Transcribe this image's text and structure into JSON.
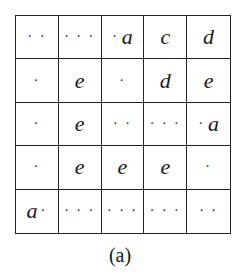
{
  "figure": {
    "caption": "(a)",
    "rows": [
      [
        {
          "dots_before": "· ·",
          "letter": "",
          "dots_after": ""
        },
        {
          "dots_before": "· · ·",
          "letter": "",
          "dots_after": ""
        },
        {
          "dots_before": "·",
          "letter": "a",
          "dots_after": ""
        },
        {
          "dots_before": "",
          "letter": "c",
          "dots_after": ""
        },
        {
          "dots_before": "",
          "letter": "d",
          "dots_after": ""
        }
      ],
      [
        {
          "dots_before": "·",
          "letter": "",
          "dots_after": ""
        },
        {
          "dots_before": "",
          "letter": "e",
          "dots_after": ""
        },
        {
          "dots_before": "·",
          "letter": "",
          "dots_after": ""
        },
        {
          "dots_before": "",
          "letter": "d",
          "dots_after": ""
        },
        {
          "dots_before": "",
          "letter": "e",
          "dots_after": ""
        }
      ],
      [
        {
          "dots_before": "·",
          "letter": "",
          "dots_after": ""
        },
        {
          "dots_before": "",
          "letter": "e",
          "dots_after": ""
        },
        {
          "dots_before": "· ·",
          "letter": "",
          "dots_after": ""
        },
        {
          "dots_before": "· · ·",
          "letter": "",
          "dots_after": ""
        },
        {
          "dots_before": "·",
          "letter": "a",
          "dots_after": ""
        }
      ],
      [
        {
          "dots_before": "·",
          "letter": "",
          "dots_after": ""
        },
        {
          "dots_before": "",
          "letter": "e",
          "dots_after": ""
        },
        {
          "dots_before": "",
          "letter": "e",
          "dots_after": ""
        },
        {
          "dots_before": "",
          "letter": "e",
          "dots_after": ""
        },
        {
          "dots_before": "·",
          "letter": "",
          "dots_after": ""
        }
      ],
      [
        {
          "dots_before": "",
          "letter": "a",
          "dots_after": "·"
        },
        {
          "dots_before": "· · ·",
          "letter": "",
          "dots_after": ""
        },
        {
          "dots_before": "· · ·",
          "letter": "",
          "dots_after": ""
        },
        {
          "dots_before": "· · ·",
          "letter": "",
          "dots_after": ""
        },
        {
          "dots_before": "· ·",
          "letter": "",
          "dots_after": ""
        }
      ]
    ]
  }
}
